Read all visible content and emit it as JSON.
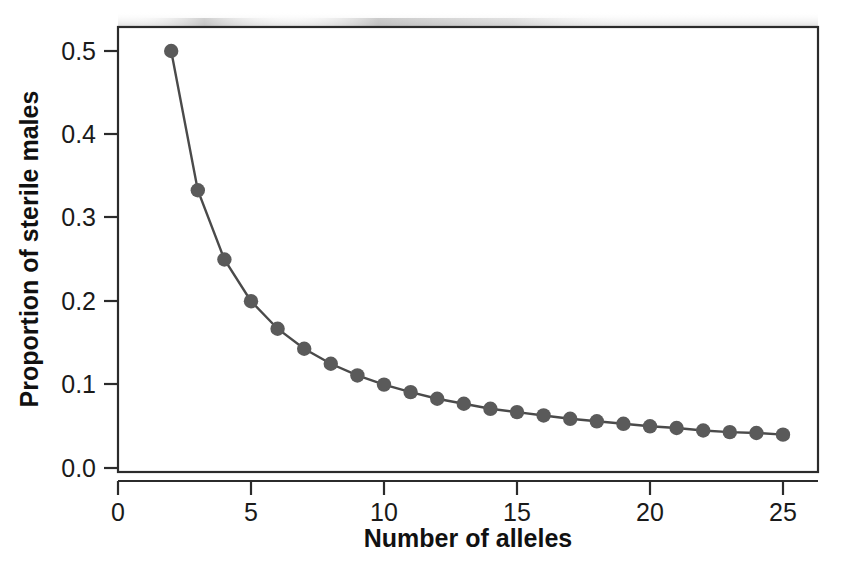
{
  "chart_data": {
    "type": "line",
    "title": "",
    "subtitle": "",
    "xlabel": "Number of alleles",
    "ylabel": "Proportion of sterile males",
    "xlim": [
      0,
      26.4
    ],
    "ylim": [
      0,
      0.53
    ],
    "xticks": [
      0,
      5,
      10,
      15,
      20,
      25
    ],
    "xtick_labels": [
      "0",
      "5",
      "10",
      "15",
      "20",
      "25"
    ],
    "yticks": [
      0.0,
      0.1,
      0.2,
      0.3,
      0.4,
      0.5
    ],
    "ytick_labels": [
      "0.0",
      "0.1",
      "0.2",
      "0.3",
      "0.4",
      "0.5"
    ],
    "grid": false,
    "legend": null,
    "series": [
      {
        "name": "Proportion of sterile males",
        "marker": "filled-circle",
        "marker_color": "#5a5a5a",
        "line_color": "#4a4a4a",
        "x": [
          2,
          3,
          4,
          5,
          6,
          7,
          8,
          9,
          10,
          11,
          12,
          13,
          14,
          15,
          16,
          17,
          18,
          19,
          20,
          21,
          22,
          23,
          24,
          25
        ],
        "values": [
          0.5,
          0.333,
          0.25,
          0.2,
          0.167,
          0.143,
          0.125,
          0.111,
          0.1,
          0.091,
          0.083,
          0.077,
          0.071,
          0.067,
          0.063,
          0.059,
          0.056,
          0.053,
          0.05,
          0.048,
          0.045,
          0.043,
          0.042,
          0.04
        ]
      }
    ],
    "annotations": []
  },
  "style": {
    "frame_color": "#2b2b2b",
    "text_color": "#1a1a1a",
    "background": "#ffffff",
    "marker_color": "#5a5a5a",
    "line_color": "#4a4a4a"
  }
}
